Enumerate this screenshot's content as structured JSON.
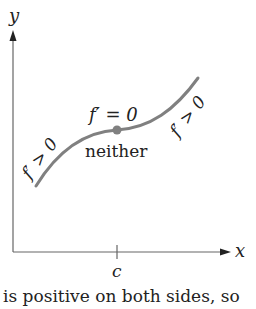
{
  "axes": {
    "y_label": "y",
    "x_label": "x",
    "tick_label": "c"
  },
  "curve": {
    "left_label": "f′ > 0",
    "right_label": "f′ > 0",
    "point_label": "f′ = 0",
    "point_caption": "neither",
    "point_color": "#808080",
    "curve_color": "#808080"
  },
  "caption": "is positive on both sides, so"
}
